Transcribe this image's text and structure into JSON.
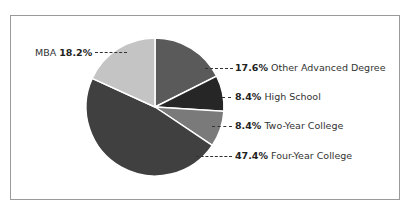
{
  "chart_data": {
    "type": "pie",
    "title": "",
    "slices": [
      {
        "label": "Other Advanced Degree",
        "value": 17.6,
        "display": "17.6%",
        "color": "#5a5a5a"
      },
      {
        "label": "High School",
        "value": 8.4,
        "display": "8.4%",
        "color": "#262626"
      },
      {
        "label": "Two-Year College",
        "value": 8.4,
        "display": "8.4%",
        "color": "#7a7a7a"
      },
      {
        "label": "Four-Year College",
        "value": 47.4,
        "display": "47.4%",
        "color": "#404040"
      },
      {
        "label": "MBA",
        "value": 18.2,
        "display": "18.2%",
        "color": "#c4c4c4"
      }
    ],
    "start_angle_deg": 0,
    "direction": "clockwise",
    "legend": "inline-callouts"
  },
  "labels": {
    "mba": {
      "name": "MBA",
      "pct": "18.2%"
    },
    "other": {
      "name": "Other Advanced Degree",
      "pct": "17.6%"
    },
    "hs": {
      "name": "High School",
      "pct": "8.4%"
    },
    "two": {
      "name": "Two-Year College",
      "pct": "8.4%"
    },
    "four": {
      "name": "Four-Year College",
      "pct": "47.4%"
    }
  }
}
